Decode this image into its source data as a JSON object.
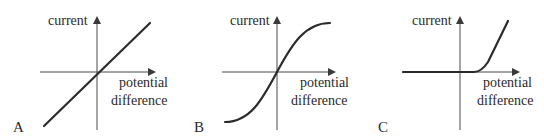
{
  "figure": {
    "panels": [
      {
        "id": "A",
        "label": "A",
        "y_axis_label": "current",
        "x_axis_label_line1": "potential",
        "x_axis_label_line2": "difference",
        "curve": "straight line through origin (ohmic conductor)"
      },
      {
        "id": "B",
        "label": "B",
        "y_axis_label": "current",
        "x_axis_label_line1": "potential",
        "x_axis_label_line2": "difference",
        "curve": "S-shaped curve through origin (filament lamp)"
      },
      {
        "id": "C",
        "label": "C",
        "y_axis_label": "current",
        "x_axis_label_line1": "potential",
        "x_axis_label_line2": "difference",
        "curve": "zero current then rising steeply after threshold (diode)"
      }
    ],
    "colors": {
      "line": "#2b2b2b",
      "axis": "#4a4a4a",
      "text": "#2a2a2a",
      "background": "#ffffff"
    }
  }
}
